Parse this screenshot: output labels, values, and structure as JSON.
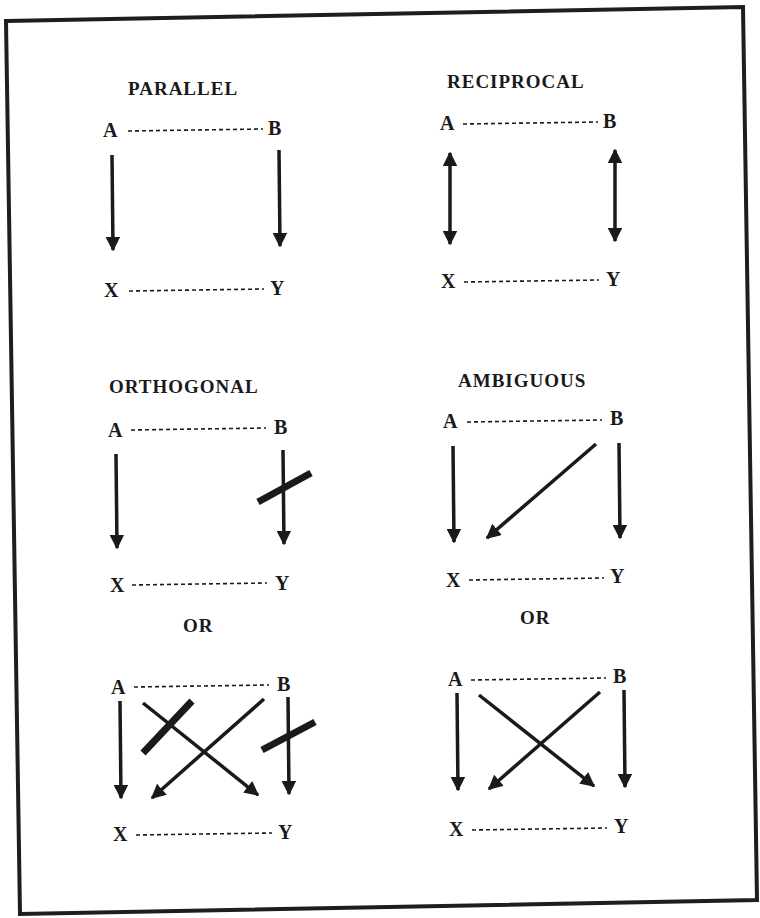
{
  "figure": {
    "frame_color": "#1e1e1e",
    "ink_color": "#1a1a1a",
    "panels": [
      {
        "id": "parallel",
        "title": "PARALLEL",
        "nodes": {
          "a": "A",
          "b": "B",
          "x": "X",
          "y": "Y"
        },
        "relations": [
          {
            "from": "A",
            "to": "X",
            "type": "causal"
          },
          {
            "from": "B",
            "to": "Y",
            "type": "causal"
          }
        ]
      },
      {
        "id": "reciprocal",
        "title": "RECIPROCAL",
        "nodes": {
          "a": "A",
          "b": "B",
          "x": "X",
          "y": "Y"
        },
        "relations": [
          {
            "from": "A",
            "to": "X",
            "type": "bidirectional"
          },
          {
            "from": "B",
            "to": "Y",
            "type": "bidirectional"
          }
        ]
      },
      {
        "id": "orthogonal",
        "title": "ORTHOGONAL",
        "nodes": {
          "a": "A",
          "b": "B",
          "x": "X",
          "y": "Y"
        },
        "relations": [
          {
            "from": "A",
            "to": "X",
            "type": "causal"
          },
          {
            "from": "B",
            "to": "Y",
            "type": "blocked"
          }
        ],
        "alt_label": "OR",
        "alternative": {
          "nodes": {
            "a": "A",
            "b": "B",
            "x": "X",
            "y": "Y"
          },
          "relations": [
            {
              "from": "A",
              "to": "X",
              "type": "causal"
            },
            {
              "from": "A",
              "to": "Y",
              "type": "blocked"
            },
            {
              "from": "B",
              "to": "X",
              "type": "causal"
            },
            {
              "from": "B",
              "to": "Y",
              "type": "blocked"
            }
          ]
        }
      },
      {
        "id": "ambiguous",
        "title": "AMBIGUOUS",
        "nodes": {
          "a": "A",
          "b": "B",
          "x": "X",
          "y": "Y"
        },
        "relations": [
          {
            "from": "A",
            "to": "X",
            "type": "causal"
          },
          {
            "from": "B",
            "to": "X",
            "type": "causal"
          },
          {
            "from": "B",
            "to": "Y",
            "type": "causal"
          }
        ],
        "alt_label": "OR",
        "alternative": {
          "nodes": {
            "a": "A",
            "b": "B",
            "x": "X",
            "y": "Y"
          },
          "relations": [
            {
              "from": "A",
              "to": "X",
              "type": "causal"
            },
            {
              "from": "A",
              "to": "Y",
              "type": "causal"
            },
            {
              "from": "B",
              "to": "X",
              "type": "causal"
            },
            {
              "from": "B",
              "to": "Y",
              "type": "causal"
            }
          ]
        }
      }
    ]
  }
}
